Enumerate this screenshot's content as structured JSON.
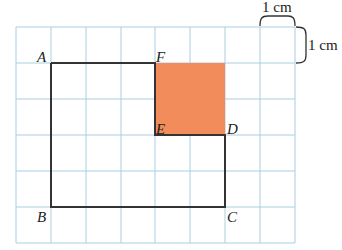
{
  "diagram": {
    "grid": {
      "columns": 8,
      "rows": 6,
      "cell_unit": "1 cm",
      "line_color": "#a9cfe3"
    },
    "scale_labels": {
      "horizontal": "1 cm",
      "vertical": "1 cm"
    },
    "points": {
      "A": {
        "label": "A",
        "col": 1,
        "row": 1
      },
      "F": {
        "label": "F",
        "col": 4,
        "row": 1
      },
      "E": {
        "label": "E",
        "col": 4,
        "row": 3
      },
      "D": {
        "label": "D",
        "col": 6,
        "row": 3
      },
      "C": {
        "label": "C",
        "col": 6,
        "row": 5
      },
      "B": {
        "label": "B",
        "col": 1,
        "row": 5
      }
    },
    "outline": [
      "A",
      "F",
      "E",
      "D",
      "C",
      "B"
    ],
    "shaded_square": {
      "corners": [
        "F",
        "E",
        "D"
      ],
      "color": "#f28c5a"
    },
    "outline_color": "#333333"
  }
}
